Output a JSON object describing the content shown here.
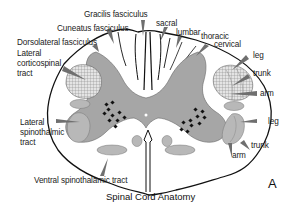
{
  "diagram": {
    "caption": "Spinal Cord Anatomy",
    "panel_letter": "A",
    "labels": {
      "gracilis": "Gracilis fasciculus",
      "cuneatus": "Cuneatus fasciculus",
      "dorsolateral": "Dorsolateral fasciculus",
      "lat_cortico_1": "Lateral",
      "lat_cortico_2": "corticospinal",
      "lat_cortico_3": "tract",
      "lat_spino_1": "Lateral",
      "lat_spino_2": "spinothalmic",
      "lat_spino_3": "tract",
      "ventral_spino": "Ventral spinothalamic tract",
      "sacral": "sacral",
      "lumbar": "lumbar",
      "thoracic": "thoracic",
      "cervical": "cervical",
      "right_upper_leg": "leg",
      "right_upper_trunk": "trunk",
      "right_upper_arm": "arm",
      "right_lower_leg": "leg",
      "right_lower_trunk": "trunk",
      "right_lower_arm": "arm"
    },
    "colors": {
      "outline": "#111111",
      "gray_matter": "#a6a6a6",
      "tract_fill": "#b8b8b8",
      "hatch": "#9a9a9a",
      "pointer": "#6f6f6f"
    }
  }
}
